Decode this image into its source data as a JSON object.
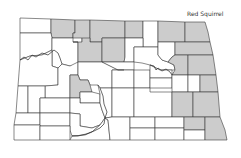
{
  "map": {
    "title": "Red Squirrel",
    "region": "North Dakota",
    "colors": {
      "present": "#cccccc",
      "absent": "#ffffff",
      "border": "#3a3a3a"
    },
    "outline": "20,18 205,22 208,32 212,40 214,55 218,75 220,95 222,118 225,130 227,140 14,140 14,125 16,100 18,60 20,40",
    "counties": [
      {
        "name": "Divide",
        "shaded": false,
        "points": "20,18 51,19 51,33 20,33"
      },
      {
        "name": "Burke",
        "shaded": true,
        "points": "51,19 75,20 75,33 73,33 73,38 52,38 51,33"
      },
      {
        "name": "Renville",
        "shaded": true,
        "points": "75,20 90,20 90,42 82,42 82,38 73,38 73,33 75,33"
      },
      {
        "name": "Bottineau",
        "shaded": true,
        "points": "90,20 125,21 125,38 102,38 102,42 90,42"
      },
      {
        "name": "Rolette",
        "shaded": true,
        "points": "125,21 143,21 143,38 125,38"
      },
      {
        "name": "Towner",
        "shaded": false,
        "points": "143,21 158,21 158,47 143,47"
      },
      {
        "name": "Cavalier",
        "shaded": true,
        "points": "158,21 185,22 185,42 158,42"
      },
      {
        "name": "Pembina",
        "shaded": true,
        "points": "185,22 205,22 208,32 210,42 185,42"
      },
      {
        "name": "Williams",
        "shaded": false,
        "points": "20,33 51,33 52,38 52,50 42,55 30,56 20,60"
      },
      {
        "name": "Mountrail",
        "shaded": false,
        "points": "52,38 73,38 73,42 78,42 78,65 70,66 62,64 58,68 52,66 52,50"
      },
      {
        "name": "Ward",
        "shaded": true,
        "points": "73,42 82,42 82,38 90,38 90,42 102,42 102,62 85,62 78,62 78,42"
      },
      {
        "name": "McHenry",
        "shaded": true,
        "points": "102,38 125,38 125,57 124,62 102,62"
      },
      {
        "name": "Pierce",
        "shaded": false,
        "points": "125,38 143,38 143,47 134,47 134,62 124,62 125,57"
      },
      {
        "name": "Benson",
        "shaded": false,
        "points": "134,47 158,47 158,55 162,60 168,62 174,65 175,70 160,70 150,65 142,63 134,62"
      },
      {
        "name": "Ramsey",
        "shaded": false,
        "points": "158,42 175,42 175,55 172,57 168,62 162,60 158,55"
      },
      {
        "name": "Walsh",
        "shaded": true,
        "points": "175,42 210,42 213,55 188,55 175,55"
      },
      {
        "name": "Nelson",
        "shaded": true,
        "points": "175,55 188,55 188,75 172,75 175,70 174,65 168,62 172,57"
      },
      {
        "name": "Grand Forks",
        "shaded": true,
        "points": "188,55 213,55 216,75 188,75"
      },
      {
        "name": "McKenzie",
        "shaded": false,
        "points": "20,60 30,56 42,55 52,50 52,66 58,68 58,85 45,86 28,86 18,86"
      },
      {
        "name": "Dunn",
        "shaded": false,
        "points": "58,68 62,64 70,66 78,62 78,75 70,75 70,98 45,98 45,86 58,85"
      },
      {
        "name": "McLean",
        "shaded": false,
        "points": "78,62 85,62 102,62 124,62 134,62 134,70 112,70 112,88 100,88 98,85 90,85 88,80 80,80 78,75"
      },
      {
        "name": "Mercer",
        "shaded": true,
        "points": "70,75 78,75 80,80 88,80 90,85 92,92 80,92 80,98 70,98"
      },
      {
        "name": "Sheridan",
        "shaded": false,
        "points": "112,70 134,70 134,88 112,88"
      },
      {
        "name": "Wells",
        "shaded": false,
        "points": "134,70 150,70 150,88 134,88"
      },
      {
        "name": "Eddy",
        "shaded": false,
        "points": "150,65 160,70 172,70 172,78 150,78"
      },
      {
        "name": "Foster",
        "shaded": false,
        "points": "150,78 172,78 172,88 150,88"
      },
      {
        "name": "Griggs",
        "shaded": false,
        "points": "172,75 188,75 188,92 172,92"
      },
      {
        "name": "Steele",
        "shaded": false,
        "points": "188,75 200,75 200,92 188,92"
      },
      {
        "name": "Traill",
        "shaded": true,
        "points": "200,75 216,75 218,92 200,92"
      },
      {
        "name": "Golden Valley",
        "shaded": false,
        "points": "18,86 28,86 28,113 16,113"
      },
      {
        "name": "Billings",
        "shaded": false,
        "points": "28,86 45,86 45,98 40,98 40,113 28,113"
      },
      {
        "name": "Stark",
        "shaded": false,
        "points": "40,98 70,98 70,113 40,113"
      },
      {
        "name": "Oliver",
        "shaded": false,
        "points": "80,92 92,92 100,94 100,103 80,103"
      },
      {
        "name": "Morton",
        "shaded": false,
        "points": "70,98 80,98 80,103 100,103 102,110 105,118 100,125 92,128 80,126 80,114 70,113"
      },
      {
        "name": "Burleigh",
        "shaded": false,
        "points": "100,88 112,88 112,117 105,118 102,110 100,103 100,94 98,85"
      },
      {
        "name": "Kidder",
        "shaded": false,
        "points": "112,88 134,88 134,117 112,117"
      },
      {
        "name": "Stutsman",
        "shaded": false,
        "points": "134,88 150,88 150,92 172,92 172,117 134,117"
      },
      {
        "name": "Barnes",
        "shaded": true,
        "points": "172,92 193,92 193,117 172,117"
      },
      {
        "name": "Cass",
        "shaded": true,
        "points": "193,92 218,92 220,117 193,117"
      },
      {
        "name": "Slope",
        "shaded": false,
        "points": "16,113 40,113 40,125 14,125"
      },
      {
        "name": "Hettinger",
        "shaded": false,
        "points": "40,113 70,113 70,126 40,126"
      },
      {
        "name": "Grant",
        "shaded": false,
        "points": "70,113 80,114 80,126 92,128 100,125 92,132 85,135 72,136 70,130"
      },
      {
        "name": "Bowman",
        "shaded": false,
        "points": "14,125 40,125 40,140 14,140"
      },
      {
        "name": "Adams",
        "shaded": false,
        "points": "40,126 70,126 70,140 40,140"
      },
      {
        "name": "Sioux",
        "shaded": false,
        "points": "72,136 85,135 92,132 100,125 105,118 108,120 110,140 70,140"
      },
      {
        "name": "Emmons",
        "shaded": false,
        "points": "105,118 112,117 130,117 130,140 110,140 108,120"
      },
      {
        "name": "Logan",
        "shaded": false,
        "points": "130,117 155,117 155,128 130,128"
      },
      {
        "name": "McIntosh",
        "shaded": false,
        "points": "130,128 155,128 155,140 130,140"
      },
      {
        "name": "LaMoure",
        "shaded": false,
        "points": "155,117 184,117 184,128 155,128"
      },
      {
        "name": "Dickey",
        "shaded": false,
        "points": "155,128 184,128 184,140 155,140"
      },
      {
        "name": "Ransom",
        "shaded": true,
        "points": "184,117 205,117 205,130 184,130"
      },
      {
        "name": "Sargent",
        "shaded": false,
        "points": "184,130 205,130 205,140 184,140"
      },
      {
        "name": "Richland",
        "shaded": true,
        "points": "205,117 220,117 225,130 227,140 205,140"
      }
    ],
    "rivers": [
      "20,60 24,57 28,60 32,55 36,57 42,53 48,55 54,50 58,53 60,58 62,64",
      "102,62 110,66 114,68 118,70 124,70",
      "150,65 154,66 156,70 158,68 162,71 166,69 170,72 172,75",
      "100,88 103,96 104,104 107,112 105,118 104,124 100,128 94,131 86,134 78,136 72,136"
    ]
  }
}
